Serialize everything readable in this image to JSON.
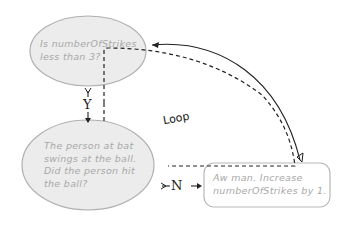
{
  "diagram": {
    "type": "flowchart",
    "nodes": [
      {
        "id": "decision1",
        "shape": "ellipse",
        "text": "Is numberOfStrikes less than 3?",
        "lines": [
          "Is numberOfStrikes",
          "less than 3?"
        ]
      },
      {
        "id": "decision2",
        "shape": "ellipse",
        "text": "The person at bat swings at the ball. Did the person hit the ball?",
        "lines": [
          "The person at bat",
          "swings at the ball.",
          "Did the person hit",
          "the ball?"
        ]
      },
      {
        "id": "action1",
        "shape": "rounded-rect",
        "text": "Aw man. Increase numberOfStrikes by 1.",
        "lines": [
          "Aw man. Increase",
          "numberOfStrikes by 1."
        ]
      }
    ],
    "edges": [
      {
        "from": "decision1",
        "to": "decision2",
        "label": "Y"
      },
      {
        "from": "decision2",
        "to": "action1",
        "label": "N"
      },
      {
        "from": "action1",
        "to": "decision1",
        "label": ""
      }
    ],
    "annotation": "Loop",
    "colors": {
      "node_fill": "#ececec",
      "node_stroke": "#b0b0b0",
      "node_text": "#a8a8a8",
      "line": "#222222"
    }
  }
}
